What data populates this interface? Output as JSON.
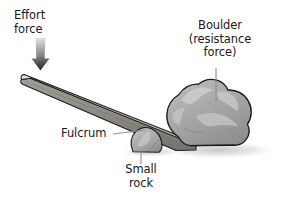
{
  "diagram": {
    "background_color": "#ffffff",
    "labels": {
      "effort_force": "Effort\nforce",
      "boulder": "Boulder\n(resistance\nforce)",
      "fulcrum": "Fulcrum",
      "small_rock": "Small\nrock"
    },
    "colors": {
      "text": "#1a1a1a",
      "leader_line": "#8c8c8c",
      "outline": "#1c1c1c",
      "plank_top": "#d2cfc9",
      "plank_side": "#8e8b85",
      "boulder_fill": "#a9a9a9",
      "boulder_highlight": "#c8c8c8",
      "rock_fill": "#b5b5b5",
      "shadow": "#d8d8d8",
      "arrow_dark": "#2a2a2a",
      "arrow_light": "#cfcfcf"
    },
    "elements": {
      "arrow": "effort-force-arrow pointing down at left end of plank",
      "plank": "long tapered board sloping down from upper-left to lower-right",
      "fulcrum_rock": "small rock under the plank acting as fulcrum",
      "boulder": "large irregular boulder resting at the lower-right end of the plank",
      "ground_shadow": "soft grey shadow beneath boulder and rock"
    }
  }
}
